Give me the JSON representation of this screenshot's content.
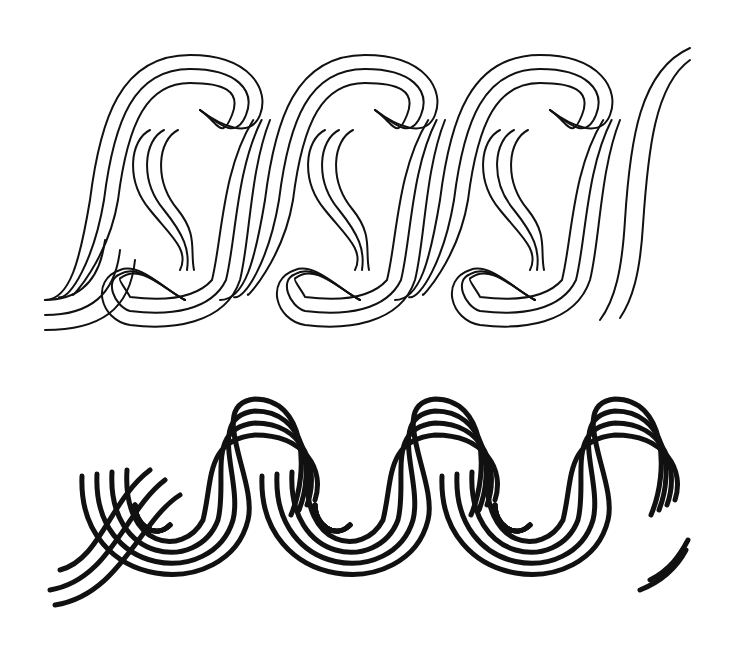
{
  "illustration": {
    "background": "#ffffff",
    "ink": "#111111",
    "borders": [
      {
        "name": "interlocking-s-scroll-border",
        "style": "outlined double-line band",
        "motif_count": 3,
        "origin_x": 40,
        "period": 175,
        "baseline_y": 190,
        "stroke_width": 2
      },
      {
        "name": "running-spiral-wave-border",
        "style": "concentric bold lines",
        "motif_count": 3,
        "origin_x": 45,
        "period": 180,
        "baseline_y": 520,
        "stroke_width": 5
      }
    ]
  }
}
